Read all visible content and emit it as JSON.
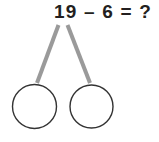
{
  "worksheet": {
    "equation": "19 – 6 = ?",
    "minuend": 19,
    "subtrahend": 6,
    "operator": "–",
    "equals": "=",
    "answer_placeholder": "?",
    "background_color": "#ffffff",
    "text_color": "#231f20"
  },
  "diagram": {
    "type": "number-bond",
    "branch_color": "#9a9a9a",
    "branch_width": 4,
    "circle_stroke_color": "#333333",
    "circle_fill_color": "#ffffff",
    "circle_stroke_width": 1.4,
    "branches": [
      {
        "x1": 58.5,
        "y1": 25,
        "x2": 37,
        "y2": 83
      },
      {
        "x1": 67.5,
        "y1": 25,
        "x2": 90,
        "y2": 83
      }
    ],
    "circles": [
      {
        "name": "left-part-circle",
        "cx": 34.5,
        "cy": 106.5,
        "r": 22,
        "value": ""
      },
      {
        "name": "right-part-circle",
        "cx": 91.5,
        "cy": 106.5,
        "r": 21.5,
        "value": ""
      }
    ]
  }
}
